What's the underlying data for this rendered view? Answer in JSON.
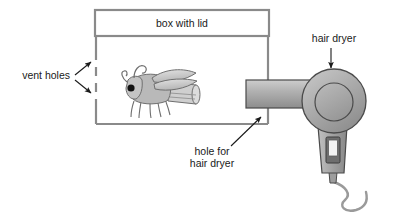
{
  "diagram": {
    "background_color": "#ffffff",
    "labels": {
      "box_with_lid": "box with lid",
      "vent_holes": "vent holes",
      "hair_dryer": "hair dryer",
      "hole_for_line1": "hole for",
      "hole_for_line2": "hair dryer"
    },
    "colors": {
      "wall_stroke": "#8a8a8a",
      "text": "#1a1a1a",
      "dryer_body_light": "#bdbdbd",
      "dryer_body_dark": "#8f8f8f",
      "dryer_outline": "#4a4a4a",
      "fly_body": "#b9b9b9",
      "fly_outline": "#6f6f6f",
      "fly_eye": "#111111",
      "cord": "#9a9a9a"
    },
    "objects": {
      "box": "box-with-lid",
      "lid": "lid-rectangle",
      "vents": "dashed-vent-section",
      "fly": "fly-illustration",
      "dryer": "hair-dryer",
      "cord": "power-cord",
      "switch": "dryer-switch"
    }
  }
}
